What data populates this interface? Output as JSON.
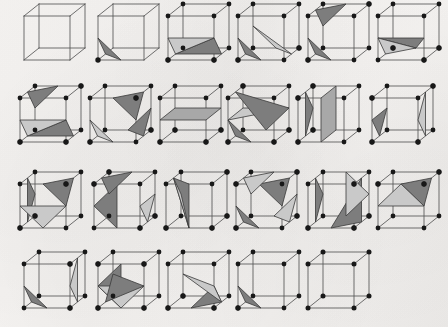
{
  "figure": {
    "subtitle": "Cube configurations with isosurface polygons",
    "media": "scanned-page",
    "background_color": "#f4f2f0",
    "edge_color": "#555555",
    "vertex_color": "#181818",
    "surface_dark_color": "#7d7d7d",
    "surface_light_color": "#c9c9c9",
    "surface_mid_color": "#a8a8a8",
    "rows": 4,
    "columns": 6,
    "case_count": 23
  },
  "projection": {
    "note": "oblique cabinet projection",
    "front": {
      "bl": [
        8,
        58
      ],
      "br": [
        54,
        58
      ],
      "tr": [
        54,
        14
      ],
      "tl": [
        8,
        14
      ]
    },
    "depth_dx": 14,
    "depth_dy": -11
  },
  "cases": [
    {
      "id": "case-0",
      "label": "0",
      "row": 1,
      "col": 1,
      "x": 18,
      "y": 10,
      "corners": [],
      "polys": []
    },
    {
      "id": "case-1",
      "label": "1",
      "row": 1,
      "col": 2,
      "x": 92,
      "y": 10,
      "corners": [
        "v0"
      ],
      "polys": [
        {
          "shade": "dark",
          "pts": "e0,e3,e8"
        }
      ]
    },
    {
      "id": "case-2",
      "label": "2",
      "row": 1,
      "col": 3,
      "x": 162,
      "y": 10,
      "corners": [
        "v0",
        "v1"
      ],
      "polys": [
        {
          "shade": "dark",
          "pts": "e3,e1,e9"
        },
        {
          "shade": "light",
          "pts": "e3,e9,e8"
        }
      ]
    },
    {
      "id": "case-3",
      "label": "3",
      "row": 1,
      "col": 4,
      "x": 232,
      "y": 10,
      "corners": [
        "v0",
        "v2"
      ],
      "polys": [
        {
          "shade": "dark",
          "pts": "e0,e3,e8"
        },
        {
          "shade": "light",
          "pts": "e1,e2,e11"
        }
      ]
    },
    {
      "id": "case-4",
      "label": "4",
      "row": 1,
      "col": 5,
      "x": 302,
      "y": 10,
      "corners": [
        "v0",
        "v6"
      ],
      "polys": [
        {
          "shade": "dark",
          "pts": "e0,e3,e8"
        },
        {
          "shade": "dark",
          "pts": "e6,e7,e11"
        }
      ]
    },
    {
      "id": "case-5",
      "label": "5",
      "row": 1,
      "col": 6,
      "x": 372,
      "y": 10,
      "corners": [
        "v1",
        "v2",
        "v3"
      ],
      "polys": [
        {
          "shade": "dark",
          "pts": "e8,e9,e2"
        },
        {
          "shade": "light",
          "pts": "e8,e2,e3"
        }
      ]
    },
    {
      "id": "case-6",
      "label": "6",
      "row": 2,
      "col": 1,
      "x": 14,
      "y": 92,
      "corners": [
        "v0",
        "v1",
        "v6"
      ],
      "polys": [
        {
          "shade": "dark",
          "pts": "e3,e1,e9"
        },
        {
          "shade": "light",
          "pts": "e3,e9,e8"
        },
        {
          "shade": "dark",
          "pts": "e6,e7,e11"
        }
      ]
    },
    {
      "id": "case-7",
      "label": "7",
      "row": 2,
      "col": 2,
      "x": 84,
      "y": 92,
      "corners": [
        "v0",
        "v2",
        "v5"
      ],
      "polys": [
        {
          "shade": "light",
          "pts": "e0,e3,e8"
        },
        {
          "shade": "dark",
          "pts": "e1,e2,e10"
        },
        {
          "shade": "dark",
          "pts": "e4,e5,e9"
        }
      ]
    },
    {
      "id": "case-8",
      "label": "8",
      "row": 2,
      "col": 3,
      "x": 154,
      "y": 92,
      "corners": [
        "v0",
        "v1",
        "v2",
        "v3"
      ],
      "polys": [
        {
          "shade": "mid",
          "pts": "e8,e9,e10,e11"
        }
      ]
    },
    {
      "id": "case-9",
      "label": "9",
      "row": 2,
      "col": 4,
      "x": 222,
      "y": 92,
      "corners": [
        "v0",
        "v1",
        "v2",
        "v7"
      ],
      "polys": [
        {
          "shade": "light",
          "pts": "e8,e10,e11"
        },
        {
          "shade": "dark",
          "pts": "e0,e8,e3"
        },
        {
          "shade": "dark",
          "pts": "e2,e10,e7"
        }
      ]
    },
    {
      "id": "case-10",
      "label": "10",
      "row": 2,
      "col": 5,
      "x": 292,
      "y": 92,
      "corners": [
        "v0",
        "v3",
        "v4",
        "v7"
      ],
      "polys": [
        {
          "shade": "mid",
          "pts": "e0,e2,e6,e4"
        },
        {
          "shade": "dark",
          "pts": "e3,e11,e7"
        }
      ]
    },
    {
      "id": "case-11",
      "label": "11",
      "row": 2,
      "col": 6,
      "x": 366,
      "y": 92,
      "corners": [
        "v0",
        "v1",
        "v4",
        "v6"
      ],
      "polys": [
        {
          "shade": "light",
          "pts": "e1,e9,e5"
        },
        {
          "shade": "dark",
          "pts": "e3,e8,e11"
        }
      ]
    },
    {
      "id": "case-12",
      "label": "12",
      "row": 3,
      "col": 1,
      "x": 14,
      "y": 178,
      "corners": [
        "v0",
        "v3",
        "v5"
      ],
      "polys": [
        {
          "shade": "dark",
          "pts": "e3,e7,e11"
        },
        {
          "shade": "light",
          "pts": "e0,e8,e9"
        },
        {
          "shade": "dark",
          "pts": "e4,e5,e9"
        }
      ]
    },
    {
      "id": "case-13",
      "label": "13",
      "row": 3,
      "col": 2,
      "x": 88,
      "y": 178,
      "corners": [
        "v1",
        "v2",
        "v4",
        "v7"
      ],
      "polys": [
        {
          "shade": "light",
          "pts": "e1,e9,e10"
        },
        {
          "shade": "dark",
          "pts": "e4,e8,e0"
        },
        {
          "shade": "dark",
          "pts": "e6,e7,e11"
        }
      ]
    },
    {
      "id": "case-14",
      "label": "14",
      "row": 3,
      "col": 3,
      "x": 160,
      "y": 178,
      "corners": [
        "v0",
        "v1",
        "v2",
        "v6"
      ],
      "polys": [
        {
          "shade": "dark",
          "pts": "e0,e4,e7"
        },
        {
          "shade": "light",
          "pts": "e0,e7,e11"
        }
      ]
    },
    {
      "id": "case-15",
      "label": "15",
      "row": 3,
      "col": 4,
      "x": 230,
      "y": 178,
      "corners": [
        "v0",
        "v2",
        "v4",
        "v6"
      ],
      "polys": [
        {
          "shade": "dark",
          "pts": "e0,e3,e8"
        },
        {
          "shade": "light",
          "pts": "e1,e2,e10"
        },
        {
          "shade": "dark",
          "pts": "e4,e5,e9"
        },
        {
          "shade": "light",
          "pts": "e6,e7,e11"
        }
      ]
    },
    {
      "id": "case-16",
      "label": "16",
      "row": 3,
      "col": 5,
      "x": 302,
      "y": 178,
      "corners": [
        "v0",
        "v1",
        "v2",
        "v5"
      ],
      "polys": [
        {
          "shade": "dark",
          "pts": "e0,e1,e5"
        },
        {
          "shade": "light",
          "pts": "e2,e6,e10"
        },
        {
          "shade": "dark",
          "pts": "e3,e7,e11"
        }
      ]
    },
    {
      "id": "case-17",
      "label": "17",
      "row": 3,
      "col": 6,
      "x": 372,
      "y": 178,
      "corners": [
        "v4",
        "v5",
        "v6"
      ],
      "polys": [
        {
          "shade": "dark",
          "pts": "e4,e5,e9"
        },
        {
          "shade": "light",
          "pts": "e4,e9,e8"
        }
      ]
    },
    {
      "id": "case-18",
      "label": "18",
      "row": 4,
      "col": 1,
      "x": 18,
      "y": 258,
      "corners": [
        "v1",
        "v5"
      ],
      "polys": [
        {
          "shade": "dark",
          "pts": "e0,e3,e8"
        },
        {
          "shade": "light",
          "pts": "e5,e9,e1"
        }
      ]
    },
    {
      "id": "case-19",
      "label": "19",
      "row": 4,
      "col": 2,
      "x": 92,
      "y": 258,
      "corners": [
        "v0",
        "v1",
        "v4",
        "v5"
      ],
      "polys": [
        {
          "shade": "dark",
          "pts": "e0,e4,e8"
        },
        {
          "shade": "light",
          "pts": "e0,e8,e9"
        },
        {
          "shade": "dark",
          "pts": "e3,e9,e11"
        }
      ]
    },
    {
      "id": "case-20",
      "label": "20",
      "row": 4,
      "col": 3,
      "x": 162,
      "y": 258,
      "corners": [
        "v0",
        "v1",
        "v3"
      ],
      "polys": [
        {
          "shade": "dark",
          "pts": "e0,e1,e9"
        },
        {
          "shade": "light",
          "pts": "e1,e9,e11"
        }
      ]
    },
    {
      "id": "case-21",
      "label": "21",
      "row": 4,
      "col": 4,
      "x": 232,
      "y": 258,
      "corners": [
        "v0"
      ],
      "polys": [
        {
          "shade": "dark",
          "pts": "e0,e3,e8"
        }
      ]
    },
    {
      "id": "case-22",
      "label": "22",
      "row": 4,
      "col": 5,
      "x": 302,
      "y": 258,
      "corners": [],
      "polys": []
    }
  ]
}
